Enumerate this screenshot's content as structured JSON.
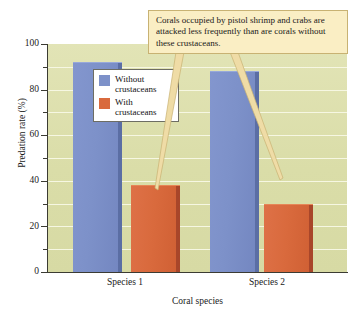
{
  "chart_data": {
    "type": "bar",
    "title": "",
    "subtitle": "",
    "categories": [
      "Species 1",
      "Species 2"
    ],
    "series": [
      {
        "name": "Without crustaceans",
        "color": "#7d91c9",
        "values": [
          92,
          88
        ]
      },
      {
        "name": "With crustaceans",
        "color": "#d96a3d",
        "values": [
          38,
          30
        ]
      }
    ],
    "xlabel": "Coral species",
    "ylabel": "Predation rate (%)",
    "ylim": [
      0,
      100
    ],
    "ytick_labels": [
      "0",
      "20",
      "40",
      "60",
      "80",
      "100"
    ],
    "ytick_values": [
      0,
      20,
      40,
      60,
      80,
      100
    ],
    "yminor_step": 10,
    "grid": "horizontal",
    "legend_position": "upper-left-inside",
    "plot_background": "#dfe1b2",
    "annotations": [
      {
        "text": "Corals occupied by pistol shrimp and crabs are attacked less frequently than are corals without these crustaceans.",
        "points_to": [
          "Species 1 / With crustaceans",
          "Species 2 / With crustaceans"
        ],
        "background": "#faeec4",
        "border": "#c8b273"
      }
    ]
  },
  "axes": {
    "y": {
      "title": "Predation rate (%)",
      "ticks": [
        {
          "label": "100",
          "value": 100
        },
        {
          "label": "80",
          "value": 80
        },
        {
          "label": "60",
          "value": 60
        },
        {
          "label": "40",
          "value": 40
        },
        {
          "label": "20",
          "value": 20
        },
        {
          "label": "0",
          "value": 0
        }
      ]
    },
    "x": {
      "title": "Coral species",
      "ticks": [
        {
          "label": "Species 1"
        },
        {
          "label": "Species 2"
        }
      ]
    }
  },
  "legend": {
    "entries": [
      {
        "label_line1": "Without",
        "label_line2": "crustaceans",
        "color": "#7d91c9"
      },
      {
        "label_line1": "With",
        "label_line2": "crustaceans",
        "color": "#d96a3d"
      }
    ]
  },
  "callout": {
    "text": "Corals occupied by pistol shrimp and crabs are attacked less frequently than are corals without these crustaceans."
  }
}
